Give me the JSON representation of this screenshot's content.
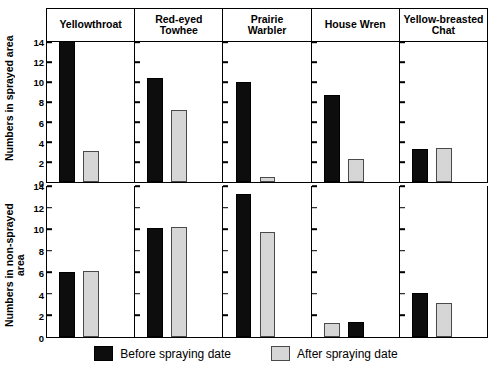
{
  "chart_data": {
    "type": "bar",
    "title": "",
    "layout": "small-multiples 2 rows x 5 columns",
    "categories": [
      "Yellowthroat",
      "Red-eyed Towhee",
      "Prairie Warbler",
      "House Wren",
      "Yellow-breasted Chat"
    ],
    "legend": {
      "position": "bottom-center",
      "entries": [
        {
          "name": "Before spraying date",
          "color": "#0d0d0d"
        },
        {
          "name": "After spraying date",
          "color": "#d6d6d6"
        }
      ]
    },
    "grid": false,
    "ylim": [
      0,
      14
    ],
    "yticks": [
      0,
      2,
      4,
      6,
      8,
      10,
      12,
      14
    ],
    "ytick_labels": [
      "0",
      "2",
      "4",
      "6",
      "8",
      "10",
      "12",
      "14"
    ],
    "panels": [
      {
        "row": 0,
        "ylabel": "Numbers in sprayed area",
        "series": [
          {
            "name": "Before spraying date",
            "values": [
              14.1,
              10.4,
              10.0,
              8.7,
              3.3
            ]
          },
          {
            "name": "After spraying date",
            "values": [
              3.1,
              7.2,
              0.5,
              2.3,
              3.4
            ]
          }
        ]
      },
      {
        "row": 1,
        "ylabel": "Numbers in non-sprayed area",
        "series": [
          {
            "name": "Before spraying date",
            "values": [
              6.0,
              10.1,
              13.3,
              1.4,
              4.1
            ]
          },
          {
            "name": "After spraying date",
            "values": [
              6.1,
              10.2,
              9.7,
              1.3,
              3.2
            ]
          }
        ],
        "note": "In the House Wren panel the After-spraying bar is drawn first (left) and the Before-spraying bar second (right)."
      }
    ]
  },
  "axes": {
    "top_ylabel": "Numbers in sprayed area",
    "bottom_ylabel": "Numbers in non-sprayed\narea",
    "tick_labels": [
      "14",
      "12",
      "10",
      "8",
      "6",
      "4",
      "2",
      "0"
    ]
  },
  "panel_titles": [
    "Yellowthroat",
    "Red-eyed\nTowhee",
    "Prairie\nWarbler",
    "House Wren",
    "Yellow-breasted\nChat"
  ],
  "legend": {
    "before_label": "Before spraying date",
    "after_label": "After spraying date"
  },
  "colors": {
    "before": "#0d0d0d",
    "after": "#d6d6d6",
    "after_border": "#4a4a4a",
    "axis": "#000000",
    "background": "#ffffff"
  }
}
